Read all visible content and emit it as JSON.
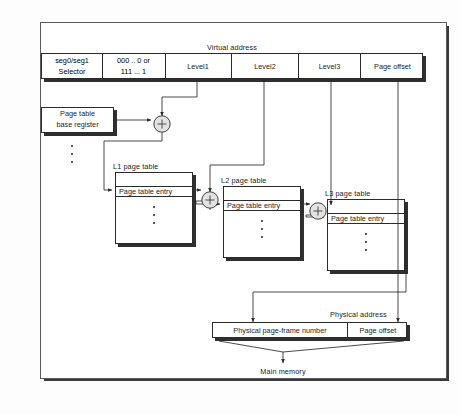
{
  "diagram": {
    "virtual_address_label": "Virtual address",
    "physical_address_label": "Physical address",
    "main_memory_label": "Main memory"
  },
  "virtual_address": {
    "selector": {
      "line1": "seg0/seg1",
      "line2": "Selector"
    },
    "segment_bits": {
      "line1": "000 ..  0 or",
      "line2": "111 ...  1"
    },
    "fields": [
      {
        "label": "Level1"
      },
      {
        "label": "Level2"
      },
      {
        "label": "Level3"
      },
      {
        "label": "Page offset"
      }
    ]
  },
  "base_register": {
    "line1": "Page table",
    "line2": "base register"
  },
  "page_tables": [
    {
      "title": "L1  page table",
      "entry_label": "Page table entry"
    },
    {
      "title": "L2  page table",
      "entry_label": "Page table entry"
    },
    {
      "title": "L3  page table",
      "entry_label": "Page table entry"
    }
  ],
  "physical_address": {
    "frame_label": "Physical page-frame number",
    "offset_label": "Page offset"
  },
  "adders": [
    {
      "name": "adder-1",
      "glyph": "+"
    },
    {
      "name": "adder-2",
      "glyph": "+"
    },
    {
      "name": "adder-3",
      "glyph": "+"
    }
  ],
  "colors": {
    "ink": "#1e1e1e",
    "line": "#2b2b2b",
    "shadow": "#2f2f2f",
    "paper": "#ffffff",
    "adder_fill": "#e2e2e2"
  }
}
